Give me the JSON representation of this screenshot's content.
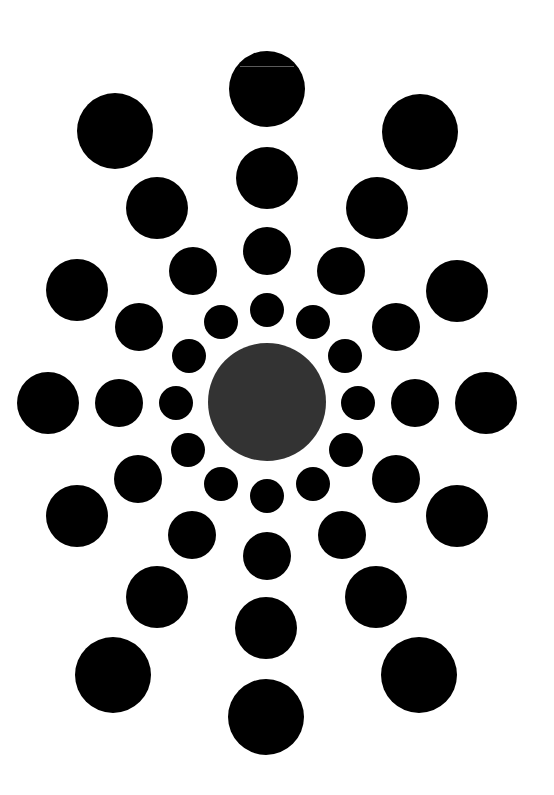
{
  "figure": {
    "background": "#ffffff",
    "dot_color": "#000000",
    "center": {
      "cx": 267,
      "cy": 402,
      "r": 59,
      "color": "#333333"
    },
    "rings": [
      {
        "name": "ring-1",
        "r": 17,
        "dots": [
          [
            267,
            310
          ],
          [
            221,
            322
          ],
          [
            313,
            322
          ],
          [
            189,
            356
          ],
          [
            345,
            356
          ],
          [
            176,
            403
          ],
          [
            358,
            403
          ],
          [
            188,
            450
          ],
          [
            346,
            450
          ],
          [
            221,
            484
          ],
          [
            313,
            484
          ],
          [
            267,
            496
          ]
        ]
      },
      {
        "name": "ring-2",
        "r": 24,
        "dots": [
          [
            267,
            251
          ],
          [
            193,
            271
          ],
          [
            341,
            271
          ],
          [
            139,
            327
          ],
          [
            396,
            327
          ],
          [
            119,
            403
          ],
          [
            415,
            403
          ],
          [
            138,
            479
          ],
          [
            396,
            479
          ],
          [
            192,
            535
          ],
          [
            342,
            535
          ],
          [
            267,
            556
          ]
        ]
      },
      {
        "name": "ring-3",
        "r": 31,
        "dots": [
          [
            267,
            178
          ],
          [
            157,
            208
          ],
          [
            377,
            208
          ],
          [
            77,
            290
          ],
          [
            457,
            291
          ],
          [
            48,
            403
          ],
          [
            486,
            403
          ],
          [
            77,
            516
          ],
          [
            457,
            516
          ],
          [
            157,
            597
          ],
          [
            376,
            597
          ],
          [
            266,
            628
          ]
        ]
      },
      {
        "name": "ring-4",
        "r": 38,
        "dots": [
          [
            267,
            89
          ],
          [
            115,
            131
          ],
          [
            420,
            132
          ],
          [
            113,
            675
          ],
          [
            419,
            675
          ],
          [
            266,
            717
          ]
        ]
      }
    ],
    "artifacts": [
      {
        "x": 240,
        "y": 66,
        "w": 54,
        "color": "#5a5a5a"
      }
    ]
  }
}
